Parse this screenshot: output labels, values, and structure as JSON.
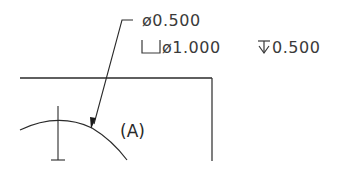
{
  "drawing": {
    "callout": {
      "hole_diameter": "ø0.500",
      "counterbore_symbol": "counterbore-icon",
      "counterbore_diameter": "ø1.000",
      "depth_symbol": "depth-icon",
      "counterbore_depth": "0.500"
    },
    "feature_label": "(A)",
    "colors": {
      "line": "#2a2a2a",
      "background": "#ffffff"
    }
  }
}
